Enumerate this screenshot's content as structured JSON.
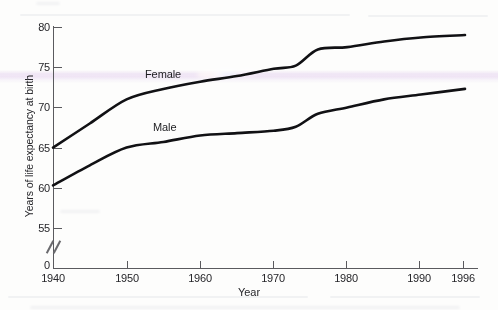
{
  "chart_data": {
    "type": "line",
    "title": "",
    "xlabel": "Year",
    "ylabel": "Years of life expectancy at birth",
    "xlim": [
      1940,
      1996
    ],
    "ylim": [
      55,
      80
    ],
    "y_axis_break": true,
    "grid": false,
    "legend_position": "inline-labels",
    "xticklabels": [
      "1940",
      "1950",
      "1960",
      "1970",
      "1980",
      "1990",
      "1996"
    ],
    "xticks": [
      1940,
      1950,
      1960,
      1970,
      1980,
      1990,
      1996
    ],
    "yticklabels": [
      "0",
      "55",
      "60",
      "65",
      "70",
      "75",
      "80"
    ],
    "yticks": [
      0,
      55,
      60,
      65,
      70,
      75,
      80
    ],
    "x": [
      1940,
      1945,
      1950,
      1955,
      1960,
      1965,
      1970,
      1973,
      1976,
      1980,
      1985,
      1990,
      1996
    ],
    "series": [
      {
        "name": "Female",
        "label": "Female",
        "values": [
          65.0,
          68.0,
          71.0,
          72.3,
          73.2,
          73.9,
          74.8,
          75.2,
          77.2,
          77.5,
          78.2,
          78.7,
          79.0
        ]
      },
      {
        "name": "Male",
        "label": "Male",
        "values": [
          60.3,
          62.8,
          65.0,
          65.7,
          66.5,
          66.8,
          67.1,
          67.6,
          69.2,
          70.0,
          71.0,
          71.6,
          72.3
        ]
      }
    ],
    "colors": {
      "line": "#111114",
      "axis": "#5a5a5e",
      "text": "#26262a",
      "background": "#fdfdfc",
      "scan_band": "#e7d6f0"
    }
  }
}
